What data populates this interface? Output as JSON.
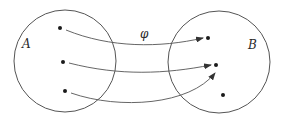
{
  "diagram": {
    "labels": {
      "set_a": "A",
      "set_b": "B",
      "mapping": "φ"
    },
    "colors": {
      "stroke": "#555555",
      "point": "#1a1a1a",
      "background": "#ffffff"
    },
    "sets": [
      {
        "name": "A",
        "cx": 65,
        "cy": 61,
        "r": 51,
        "points": [
          {
            "x": 60,
            "y": 28
          },
          {
            "x": 63,
            "y": 62
          },
          {
            "x": 65,
            "y": 91
          }
        ]
      },
      {
        "name": "B",
        "cx": 219,
        "cy": 62,
        "r": 51,
        "points": [
          {
            "x": 208,
            "y": 38
          },
          {
            "x": 216,
            "y": 65
          },
          {
            "x": 223,
            "y": 95
          }
        ]
      }
    ],
    "arrows": [
      {
        "from": "A.0",
        "to": "B.0"
      },
      {
        "from": "A.1",
        "to": "B.1"
      },
      {
        "from": "A.2",
        "to": "B.1"
      }
    ]
  }
}
